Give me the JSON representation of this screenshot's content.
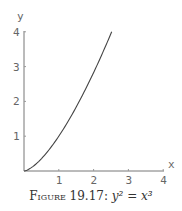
{
  "chart_data": {
    "type": "line",
    "title": "",
    "caption_label": "Figure 19.17:",
    "caption_eq": "y² = x³",
    "xlabel": "x",
    "ylabel": "y",
    "xlim": [
      0,
      4
    ],
    "ylim": [
      0,
      4
    ],
    "x_ticks": [
      "1",
      "2",
      "3",
      "4"
    ],
    "y_ticks": [
      "1",
      "2",
      "3",
      "4"
    ],
    "grid": false,
    "series": [
      {
        "name": "y = x^(3/2)",
        "x": [
          0,
          0.5,
          1,
          1.5,
          2,
          2.52
        ],
        "values": [
          0,
          0.354,
          1,
          1.837,
          2.828,
          4
        ]
      }
    ]
  },
  "axes": {
    "x_label": "x",
    "y_label": "y"
  },
  "caption": {
    "label": "Figure 19.17:",
    "equation": "y² = x³"
  }
}
